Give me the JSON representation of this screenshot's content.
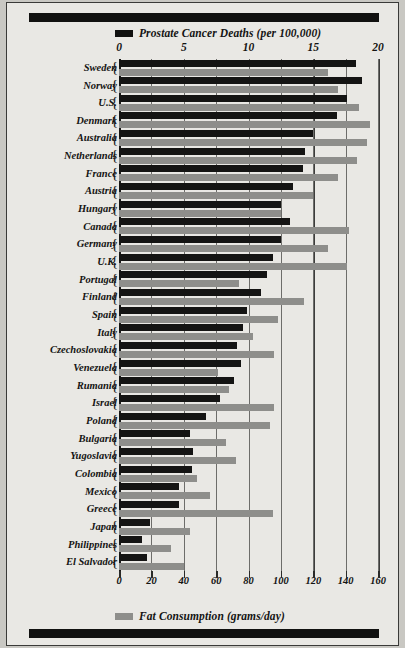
{
  "chart_data": {
    "type": "bar",
    "orientation": "horizontal",
    "title": "",
    "legend": [
      {
        "name": "Prostate Cancer Deaths (per 100,000)",
        "color": "#141413",
        "swatch": "black"
      },
      {
        "name": "Fat Consumption (grams/day)",
        "color": "#8e8e8b",
        "swatch": "gray"
      }
    ],
    "legend_position": "top and bottom",
    "grid": true,
    "axis_top": {
      "label": "Prostate Cancer Deaths (per 100,000)",
      "ticks": [
        "0",
        "5",
        "10",
        "15",
        "20"
      ],
      "range": [
        0,
        20
      ]
    },
    "axis_bottom": {
      "label": "Fat Consumption (grams/day)",
      "ticks": [
        "0",
        "20",
        "40",
        "60",
        "80",
        "100",
        "120",
        "140",
        "160"
      ],
      "range": [
        0,
        160
      ]
    },
    "categories": [
      "Sweden",
      "Norway",
      "U.S.",
      "Denmark",
      "Australia",
      "Netherlands",
      "France",
      "Austria",
      "Hungary",
      "Canada",
      "Germany",
      "U.K.",
      "Portugal",
      "Finland",
      "Spain",
      "Italy",
      "Czechoslovakia",
      "Venezuela",
      "Rumania",
      "Israel",
      "Poland",
      "Bulgaria",
      "Yugoslavia",
      "Colombia",
      "Mexico",
      "Greece",
      "Japan",
      "Philippines",
      "El Salvador"
    ],
    "series": [
      {
        "name": "Prostate Cancer Deaths (per 100,000)",
        "axis": "top",
        "color": "#141413",
        "values": [
          18.3,
          18.8,
          17.6,
          16.8,
          15.0,
          14.4,
          14.2,
          13.4,
          12.5,
          13.2,
          12.5,
          11.9,
          11.4,
          11.0,
          9.9,
          9.6,
          9.1,
          9.4,
          8.9,
          7.8,
          6.7,
          5.5,
          5.7,
          5.6,
          4.6,
          4.6,
          2.4,
          1.8,
          2.2
        ]
      },
      {
        "name": "Fat Consumption (grams/day)",
        "axis": "bottom",
        "color": "#8e8e8b",
        "values": [
          129,
          135,
          148,
          155,
          153,
          147,
          135,
          120,
          100,
          142,
          129,
          141,
          74,
          114,
          98,
          83,
          96,
          61,
          68,
          96,
          93,
          66,
          72,
          48,
          56,
          95,
          44,
          32,
          40
        ]
      }
    ]
  }
}
